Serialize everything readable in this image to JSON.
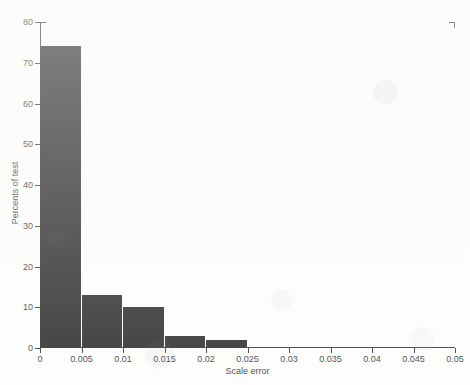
{
  "chart_data": {
    "type": "bar",
    "title": "",
    "subtitle": "",
    "xlabel": "Scale error",
    "ylabel": "Percents of test",
    "xlim": [
      0,
      0.05
    ],
    "ylim": [
      0,
      80
    ],
    "grid": false,
    "legend": null,
    "legend_position": "none",
    "bar_color": "#111111",
    "axis_color": "#232323",
    "background_color": "#fdfdfc",
    "bin_width": 0.005,
    "x_tick_labels": [
      "0",
      "0.005",
      "0.01",
      "0.015",
      "0.02",
      "0.025",
      "0.03",
      "0.035",
      "0.04",
      "0.045",
      "0.05"
    ],
    "x_tick_values": [
      0,
      0.005,
      0.01,
      0.015,
      0.02,
      0.025,
      0.03,
      0.035,
      0.04,
      0.045,
      0.05
    ],
    "y_tick_labels": [
      "0",
      "10",
      "20",
      "30",
      "40",
      "50",
      "60",
      "70",
      "80"
    ],
    "y_tick_values": [
      0,
      10,
      20,
      30,
      40,
      50,
      60,
      70,
      80
    ],
    "categories": [
      "0-0.005",
      "0.005-0.01",
      "0.01-0.015",
      "0.015-0.02",
      "0.02-0.025",
      "0.025-0.03",
      "0.03-0.035",
      "0.035-0.04",
      "0.04-0.045",
      "0.045-0.05"
    ],
    "bins": [
      {
        "x0": 0,
        "x1": 0.005,
        "value": 74
      },
      {
        "x0": 0.005,
        "x1": 0.01,
        "value": 13
      },
      {
        "x0": 0.01,
        "x1": 0.015,
        "value": 10
      },
      {
        "x0": 0.015,
        "x1": 0.02,
        "value": 3
      },
      {
        "x0": 0.02,
        "x1": 0.025,
        "value": 2
      },
      {
        "x0": 0.025,
        "x1": 0.03,
        "value": 0
      },
      {
        "x0": 0.03,
        "x1": 0.035,
        "value": 0
      },
      {
        "x0": 0.035,
        "x1": 0.04,
        "value": 0
      },
      {
        "x0": 0.04,
        "x1": 0.045,
        "value": 0
      },
      {
        "x0": 0.045,
        "x1": 0.05,
        "value": 0
      }
    ],
    "values": [
      74,
      13,
      10,
      3,
      2,
      0,
      0,
      0,
      0,
      0
    ]
  }
}
